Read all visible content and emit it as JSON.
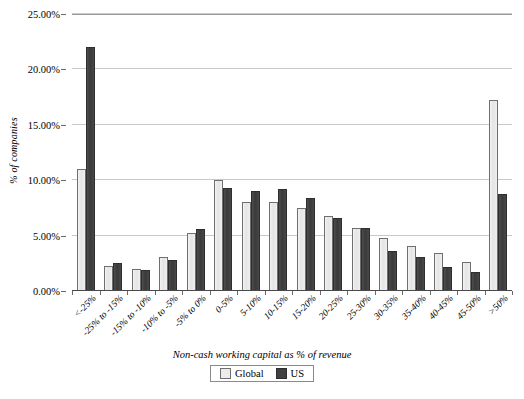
{
  "chart_data": {
    "type": "bar",
    "title": "",
    "xlabel": "Non-cash working capital as % of revenue",
    "ylabel": "% of companies",
    "ylim": [
      0,
      25
    ],
    "ytick_step": 5,
    "ytick_labels": [
      "0.00%",
      "5.00%",
      "10.00%",
      "15.00%",
      "20.00%",
      "25.00%"
    ],
    "ytick_values": [
      0,
      5,
      10,
      15,
      20,
      25
    ],
    "grid": true,
    "legend_position": "bottom",
    "categories": [
      "<-25%",
      "-25% to -15%",
      "-15% to -10%",
      "-10% to -5%",
      "-5% to 0%",
      "0-5%",
      "5-10%",
      "10-15%",
      "15-20%",
      "20-25%",
      "25-30%",
      "30-35%",
      "35-40%",
      "40-45%",
      "45-50%",
      ">50%"
    ],
    "series": [
      {
        "name": "Global",
        "color": "#ececec",
        "values": [
          11.0,
          2.3,
          2.0,
          3.1,
          5.2,
          10.0,
          8.0,
          8.0,
          7.5,
          6.8,
          5.7,
          4.8,
          4.1,
          3.4,
          2.6,
          17.2
        ]
      },
      {
        "name": "US",
        "color": "#404040",
        "values": [
          22.0,
          2.5,
          1.9,
          2.8,
          5.6,
          9.3,
          9.0,
          9.2,
          8.4,
          6.6,
          5.7,
          3.6,
          3.1,
          2.2,
          1.7,
          8.8
        ]
      }
    ]
  }
}
